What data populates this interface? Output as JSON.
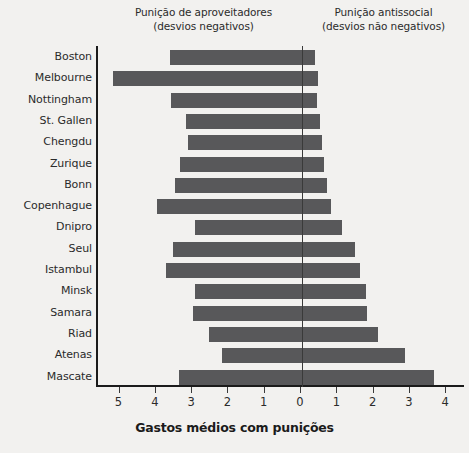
{
  "header": {
    "left_line1": "Punição de aproveitadores",
    "left_line2": "(desvios negativos)",
    "right_line1": "Punição antissocial",
    "right_line2": "(desvios não negativos)"
  },
  "axis": {
    "x_title": "Gastos médios com punições",
    "tick_labels": [
      "5",
      "4",
      "3",
      "2",
      "1",
      "0",
      "1",
      "2",
      "3",
      "4"
    ],
    "tick_values": [
      -5,
      -4,
      -3,
      -2,
      -1,
      0,
      1,
      2,
      3,
      4
    ]
  },
  "style": {
    "bar_color": "#58585a",
    "axis_color": "#1b1b1b",
    "background": "#f2f1ef",
    "text_color": "#2b2b2b"
  },
  "chart_data": {
    "type": "bar",
    "orientation": "horizontal",
    "title": "",
    "subtitle": "",
    "xlabel": "Gastos médios com punições",
    "ylabel": "",
    "xlim": [
      -5.6,
      4.5
    ],
    "grid": false,
    "legend": null,
    "annotations": [
      "Punição de aproveitadores (desvios negativos)",
      "Punição antissocial (desvios não negativos)"
    ],
    "categories": [
      "Boston",
      "Melbourne",
      "Nottingham",
      "St. Gallen",
      "Chengdu",
      "Zurique",
      "Bonn",
      "Copenhague",
      "Dnipro",
      "Seul",
      "Istambul",
      "Minsk",
      "Samara",
      "Riad",
      "Atenas",
      "Mascate"
    ],
    "series": [
      {
        "name": "Punição de aproveitadores (desvios negativos)",
        "values": [
          -3.65,
          -5.2,
          -3.6,
          -3.2,
          -3.15,
          -3.35,
          -3.5,
          -4.0,
          -2.95,
          -3.55,
          -3.75,
          -2.95,
          -3.0,
          -2.55,
          -2.2,
          -3.4
        ]
      },
      {
        "name": "Punição antissocial (desvios não negativos)",
        "values": [
          0.35,
          0.45,
          0.4,
          0.5,
          0.55,
          0.6,
          0.7,
          0.8,
          1.1,
          1.45,
          1.6,
          1.75,
          1.8,
          2.1,
          2.85,
          3.65
        ]
      }
    ]
  }
}
